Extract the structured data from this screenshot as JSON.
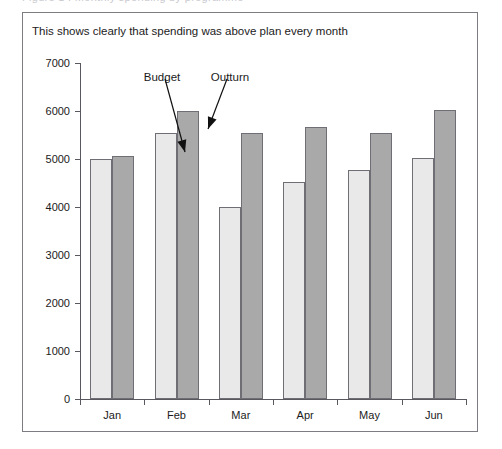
{
  "clipped_header_text": "Figure 1 : Monthly spending by programme",
  "chart_data": {
    "type": "bar",
    "title": "This shows clearly that spending was above plan every month",
    "xlabel": "",
    "ylabel": "",
    "ylim": [
      0,
      7000
    ],
    "ytick_step": 1000,
    "yticks": [
      0,
      1000,
      2000,
      3000,
      4000,
      5000,
      6000,
      7000
    ],
    "ytick_labels": [
      "0",
      "1000",
      "2000",
      "3000",
      "4000",
      "5000",
      "6000",
      "7000"
    ],
    "grid": false,
    "legend": "annotations",
    "categories": [
      "Jan",
      "Feb",
      "Mar",
      "Apr",
      "May",
      "Jun"
    ],
    "series": [
      {
        "name": "Budget",
        "color": "#e9e9e9",
        "values": [
          5000,
          5550,
          4010,
          4520,
          4780,
          5030
        ]
      },
      {
        "name": "Outturn",
        "color": "#a9a9a9",
        "values": [
          5060,
          6010,
          5550,
          5660,
          5550,
          6020
        ]
      }
    ],
    "annotations": [
      {
        "text": "Budget",
        "points_to": "Feb Budget bar",
        "label_x": 139,
        "label_y": 58,
        "arrow_from_x": 142,
        "arrow_from_y": 66,
        "arrow_to_x": 162,
        "arrow_to_y": 139
      },
      {
        "text": "Outturn",
        "points_to": "Feb Outturn bar",
        "label_x": 207,
        "label_y": 58,
        "arrow_from_x": 204,
        "arrow_from_y": 66,
        "arrow_to_x": 185,
        "arrow_to_y": 116
      }
    ]
  },
  "colors": {
    "budget_fill": "#e9e9e9",
    "outturn_fill": "#a9a9a9",
    "bar_stroke": "#6e6e74",
    "axis": "#58585e",
    "frame_border": "#7c7c82",
    "text": "#1b1b1b"
  }
}
